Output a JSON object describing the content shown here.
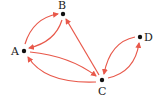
{
  "graph": {
    "type": "directed",
    "edge_color": "#e8584a",
    "node_color": "#111111",
    "nodes": [
      {
        "id": "A",
        "label": "A",
        "x": 24,
        "y": 51
      },
      {
        "id": "B",
        "label": "B",
        "x": 63,
        "y": 14
      },
      {
        "id": "C",
        "label": "C",
        "x": 102,
        "y": 80
      },
      {
        "id": "D",
        "label": "D",
        "x": 140,
        "y": 37
      }
    ],
    "edges": [
      {
        "from": "A",
        "to": "B"
      },
      {
        "from": "B",
        "to": "A"
      },
      {
        "from": "C",
        "to": "B"
      },
      {
        "from": "A",
        "to": "C"
      },
      {
        "from": "C",
        "to": "A"
      },
      {
        "from": "C",
        "to": "D"
      },
      {
        "from": "D",
        "to": "C"
      }
    ]
  }
}
